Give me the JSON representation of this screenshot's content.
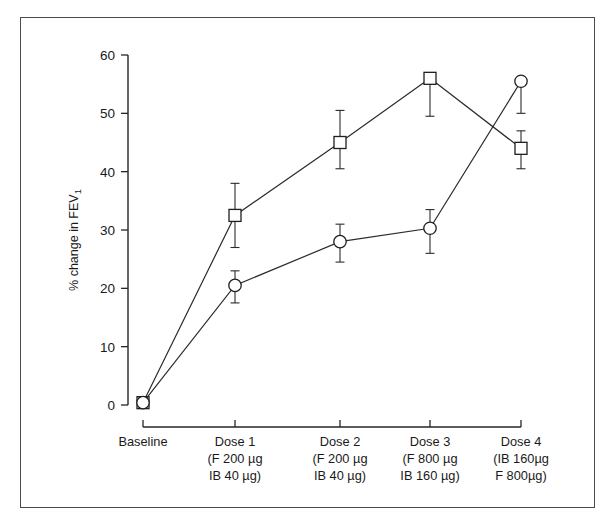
{
  "chart_data": {
    "type": "line",
    "title": "",
    "xlabel": "",
    "ylabel": "% change in FEV",
    "ylabel_subscript": "1",
    "ylim": [
      0,
      60
    ],
    "yticks": [
      0,
      10,
      20,
      30,
      40,
      50,
      60
    ],
    "ytick_labels": [
      "0",
      "10",
      "20",
      "30",
      "40",
      "50",
      "60"
    ],
    "grid": false,
    "legend": "none",
    "categories": [
      "Baseline",
      "Dose 1",
      "Dose 2",
      "Dose 3",
      "Dose 4"
    ],
    "category_details": [
      {
        "name": "Baseline",
        "line1": "Baseline",
        "line2": "",
        "line3": ""
      },
      {
        "name": "Dose 1",
        "line1": "Dose 1",
        "line2": "(F 200 µg",
        "line3": "IB 40 µg)"
      },
      {
        "name": "Dose 2",
        "line1": "Dose 2",
        "line2": "(F 200 µg",
        "line3": "IB 40 µg)"
      },
      {
        "name": "Dose 3",
        "line1": "Dose 3",
        "line2": "(F 800 µg",
        "line3": "IB 160 µg)"
      },
      {
        "name": "Dose 4",
        "line1": "Dose 4",
        "line2": "(IB 160µg",
        "line3": "F 800µg)"
      }
    ],
    "series": [
      {
        "name": "square-series",
        "marker": "open-square",
        "values": [
          0.4,
          32.5,
          45.0,
          56.0,
          44.0
        ],
        "err_upper": [
          0.4,
          38.0,
          50.5,
          56.0,
          47.0
        ],
        "err_lower": [
          0.4,
          27.0,
          40.5,
          49.5,
          40.5
        ]
      },
      {
        "name": "circle-series",
        "marker": "open-circle",
        "values": [
          0.4,
          20.5,
          28.0,
          30.3,
          55.5
        ],
        "err_upper": [
          0.4,
          23.0,
          31.0,
          33.5,
          55.5
        ],
        "err_lower": [
          0.4,
          17.5,
          24.5,
          26.0,
          50.0
        ]
      }
    ]
  },
  "colors": {
    "background": "#ffffff",
    "frame": "#4a4a4a",
    "axis": "#262626",
    "ink": "#1f1f1f"
  }
}
